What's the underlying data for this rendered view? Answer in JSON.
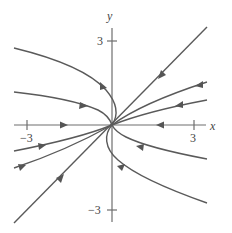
{
  "figure": {
    "type": "phase-portrait",
    "axes": {
      "x_label": "x",
      "y_label": "y",
      "x_ticks": [
        {
          "value": -3,
          "label": "−3"
        },
        {
          "value": 3,
          "label": "3"
        }
      ],
      "y_ticks": [
        {
          "value": 3,
          "label": "3"
        },
        {
          "value": -3,
          "label": "−3"
        }
      ]
    },
    "equilibrium": "origin (stable node, all trajectories approach)",
    "trajectories": [
      "straight-line solution along diagonal y = x, both halves flowing toward origin",
      "x-axis: both halves flowing toward origin",
      "upper-left curves entering origin from the left, one bending around past y-axis",
      "upper-right curves entering origin tangent to diagonal",
      "lower-left curves entering origin tangent to diagonal",
      "lower-right curves entering origin, one bending around past y-axis"
    ]
  }
}
